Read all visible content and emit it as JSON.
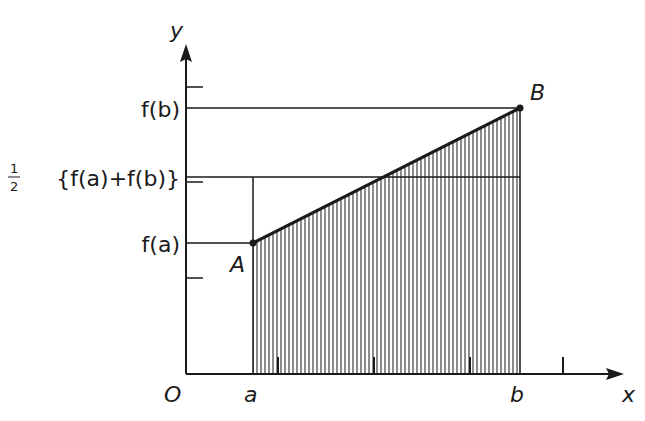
{
  "diagram": {
    "axes": {
      "x_label": "x",
      "y_label": "y",
      "origin_label": "O"
    },
    "x_labels": {
      "a": "a",
      "b": "b"
    },
    "y_labels": {
      "fb": "f(b)",
      "mid_prefix_num": "1",
      "mid_prefix_den": "2",
      "mid": "{f(a)+f(b)}",
      "fa": "f(a)"
    },
    "points": {
      "A": "A",
      "B": "B"
    },
    "geometry": {
      "origin": [
        186,
        374
      ],
      "x_axis_end": 620,
      "y_axis_end": 48,
      "a_x": 253,
      "b_x": 520,
      "fa_y": 243,
      "fb_y": 108,
      "mid_y": 177,
      "y_ticks": [
        87,
        182,
        278
      ],
      "x_ticks": [
        278,
        374,
        470,
        563
      ],
      "hatch_spacing": 4
    },
    "colors": {
      "ink": "#1a1a1a",
      "background": "#ffffff"
    }
  }
}
